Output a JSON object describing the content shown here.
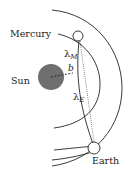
{
  "diagram": {
    "labels": {
      "mercury": "Mercury",
      "sun": "Sun",
      "earth": "Earth",
      "lambda_m": "λ",
      "lambda_m_sub": "M",
      "lambda_e": "λ",
      "lambda_e_sub": "E",
      "b": "b"
    },
    "colors": {
      "sun_fill": "#6e6e6e",
      "stroke": "#222222",
      "background": "#ffffff"
    }
  }
}
